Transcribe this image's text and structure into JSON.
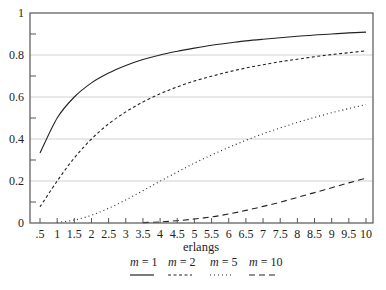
{
  "chart_data": {
    "type": "line",
    "title": "",
    "xlabel": "erlangs",
    "ylabel": "",
    "xlim": [
      0.2,
      10.2
    ],
    "ylim": [
      0,
      1
    ],
    "x_ticks": [
      0.5,
      1,
      1.5,
      2,
      2.5,
      3,
      3.5,
      4,
      4.5,
      5,
      5.5,
      6,
      6.5,
      7,
      7.5,
      8,
      8.5,
      9,
      9.5,
      10
    ],
    "x_tick_labels": [
      ".5",
      "1",
      "1.5",
      "2",
      "2.5",
      "3",
      "3.5",
      "4",
      "4.5",
      "5",
      "5.5",
      "6",
      "6.5",
      "7",
      "7.5",
      "8",
      "8.5",
      "9",
      "9.5",
      "10"
    ],
    "y_ticks": [
      0,
      0.2,
      0.4,
      0.6,
      0.8,
      1
    ],
    "y_tick_labels": [
      "0",
      "0.2",
      "0.4",
      "0.6",
      "0.8",
      "1"
    ],
    "y_minor_ticks": [
      0.1,
      0.3,
      0.5,
      0.7,
      0.9
    ],
    "grid": {
      "horizontal": [
        0.2,
        0.4,
        0.6,
        0.8
      ],
      "vertical": false,
      "color": "#cfcfcf"
    },
    "legend_position": "bottom",
    "x": [
      0.5,
      1,
      1.5,
      2,
      2.5,
      3,
      3.5,
      4,
      4.5,
      5,
      5.5,
      6,
      6.5,
      7,
      7.5,
      8,
      8.5,
      9,
      9.5,
      10
    ],
    "series": [
      {
        "name": "m = 1",
        "var": "m",
        "val": "1",
        "style": "solid",
        "dash": "",
        "width": 1.1,
        "values": [
          0.333,
          0.5,
          0.6,
          0.667,
          0.714,
          0.75,
          0.778,
          0.8,
          0.818,
          0.833,
          0.846,
          0.857,
          0.867,
          0.875,
          0.882,
          0.889,
          0.895,
          0.9,
          0.905,
          0.909
        ]
      },
      {
        "name": "m = 2",
        "var": "m",
        "val": "2",
        "style": "dashed",
        "dash": "3,2.5",
        "width": 1.1,
        "values": [
          0.077,
          0.2,
          0.31,
          0.4,
          0.472,
          0.529,
          0.576,
          0.615,
          0.648,
          0.676,
          0.699,
          0.72,
          0.738,
          0.754,
          0.768,
          0.78,
          0.792,
          0.802,
          0.811,
          0.82
        ]
      },
      {
        "name": "m = 5",
        "var": "m",
        "val": "5",
        "style": "dotted",
        "dash": "1,3",
        "width": 1.1,
        "values": [
          0.0002,
          0.003,
          0.014,
          0.037,
          0.07,
          0.11,
          0.154,
          0.199,
          0.243,
          0.285,
          0.324,
          0.36,
          0.394,
          0.425,
          0.453,
          0.479,
          0.503,
          0.525,
          0.545,
          0.564
        ]
      },
      {
        "name": "m = 10",
        "var": "m",
        "val": "10",
        "style": "long-dashed",
        "dash": "6,4",
        "width": 1.1,
        "values": [
          0.0,
          0.0,
          0.0,
          0.0,
          0.0,
          0.0,
          0.002,
          0.005,
          0.011,
          0.019,
          0.029,
          0.043,
          0.06,
          0.079,
          0.099,
          0.122,
          0.145,
          0.168,
          0.191,
          0.214
        ],
        "start_x": 3.5
      }
    ]
  },
  "colors": {
    "line": "#222222",
    "axis": "#555555",
    "grid": "#d0d0d0"
  }
}
